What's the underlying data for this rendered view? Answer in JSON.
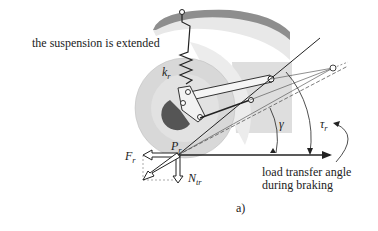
{
  "caption": "a)",
  "labels": {
    "state": "the suspension is extended",
    "spring": "k",
    "spring_sub": "r",
    "contact_point": "P",
    "contact_point_sub": "r",
    "force_longitudinal": "F",
    "force_longitudinal_sub": "r",
    "force_normal": "N",
    "force_normal_sub": "tr",
    "angle_gamma": "γ",
    "angle_tau": "τ",
    "angle_tau_sub": "r",
    "annotation_line1": "load transfer angle",
    "annotation_line2": "during braking"
  },
  "colors": {
    "frame": "#9a9a9a",
    "wheel": "#dcdcdc",
    "fender_fill": "#e6e6e6",
    "hub": "#555555",
    "line": "#222222",
    "shade": "#d9d9d9"
  }
}
